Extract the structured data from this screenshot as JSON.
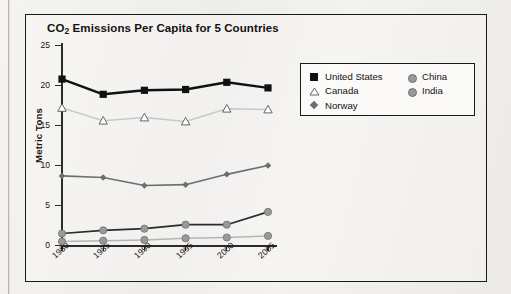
{
  "chart_data": {
    "type": "line",
    "title": "CO2 Emissions Per Capita for 5 Countries",
    "title_main": "CO",
    "title_sub": "2",
    "title_rest": " Emissions Per Capita for 5 Countries",
    "xlabel": "",
    "ylabel": "Metric Tons",
    "x": [
      "1980",
      "1985",
      "1990",
      "1995",
      "2000",
      "2005"
    ],
    "categories": [
      "1980",
      "1985",
      "1990",
      "1995",
      "2000",
      "2005"
    ],
    "yticks": [
      "25",
      "20",
      "15",
      "10",
      "5",
      "0"
    ],
    "ylim": [
      0,
      25
    ],
    "grid": false,
    "legend_position": "upper right",
    "series": [
      {
        "name": "United States",
        "marker": "filled-square",
        "color": "#111111",
        "line_color": "#111111",
        "values": [
          20.8,
          18.9,
          19.4,
          19.5,
          20.4,
          19.7
        ]
      },
      {
        "name": "Canada",
        "marker": "open-triangle",
        "color": "#ffffff",
        "line_color": "#c8c8c8",
        "values": [
          17.2,
          15.6,
          16.0,
          15.5,
          17.1,
          17.0
        ]
      },
      {
        "name": "Norway",
        "marker": "diamond",
        "color": "#6e6e6e",
        "line_color": "#6e6e6e",
        "values": [
          8.7,
          8.5,
          7.5,
          7.6,
          8.9,
          10.0
        ]
      },
      {
        "name": "China",
        "marker": "circle",
        "color": "#9a9a9a",
        "line_color": "#2b2b2b",
        "values": [
          1.5,
          1.9,
          2.1,
          2.6,
          2.6,
          4.2
        ]
      },
      {
        "name": "India",
        "marker": "circle",
        "color": "#9a9a9a",
        "line_color": "#b5b5b5",
        "values": [
          0.5,
          0.6,
          0.7,
          0.9,
          1.0,
          1.2
        ]
      }
    ],
    "legend": {
      "left_column": [
        {
          "label": "United States",
          "marker": "filled-square"
        },
        {
          "label": "Canada",
          "marker": "open-triangle"
        },
        {
          "label": "Norway",
          "marker": "diamond"
        }
      ],
      "right_column": [
        {
          "label": "China",
          "marker": "circle"
        },
        {
          "label": "India",
          "marker": "circle"
        }
      ]
    }
  }
}
